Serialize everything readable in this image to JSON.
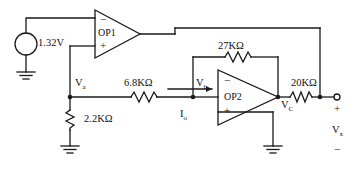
{
  "source": {
    "name": "dc-voltage-source",
    "value": "1.32V",
    "polarity_top": "−",
    "polarity_bottom": "+"
  },
  "opamps": [
    {
      "name": "OP1",
      "label": "OP1",
      "inv_sign": "−",
      "non_inv_sign": "+"
    },
    {
      "name": "OP2",
      "label": "OP2",
      "inv_sign": "−",
      "non_inv_sign": "+"
    }
  ],
  "resistors": [
    {
      "name": "R-2K2",
      "value": "2.2K",
      "unit": "Ω",
      "orientation": "vertical"
    },
    {
      "name": "R-6K8",
      "value": "6.8K",
      "unit": "Ω",
      "orientation": "horizontal"
    },
    {
      "name": "R-27K",
      "value": "27K",
      "unit": "Ω",
      "orientation": "horizontal"
    },
    {
      "name": "R-20K",
      "value": "20K",
      "unit": "Ω",
      "orientation": "horizontal"
    }
  ],
  "nodes": [
    {
      "name": "node-va",
      "label": "V",
      "sub": "a"
    },
    {
      "name": "node-vb",
      "label": "V",
      "sub": "b"
    },
    {
      "name": "node-vc",
      "label": "V",
      "sub": "C"
    }
  ],
  "currents": [
    {
      "name": "current-io",
      "label": "I",
      "sub": "o"
    }
  ],
  "output_port": {
    "plus": "+",
    "minus": "−",
    "label": "V",
    "sub": "x"
  },
  "colors": {
    "wire": "#1a1a1a",
    "text": "#111111",
    "background": "#ffffff"
  }
}
